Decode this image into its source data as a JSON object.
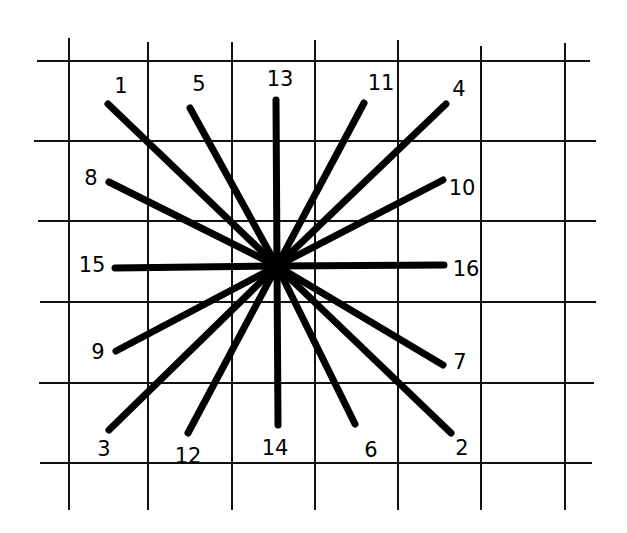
{
  "diagram": {
    "type": "radial line star on grid paper",
    "colors": {
      "background": "#ffffff",
      "ink": "#000000"
    },
    "center": {
      "x": 277,
      "y": 266
    },
    "grid": {
      "vertical": [
        {
          "x": 69,
          "y1": 38,
          "y2": 510
        },
        {
          "x": 148,
          "y1": 42,
          "y2": 510
        },
        {
          "x": 232,
          "y1": 42,
          "y2": 510
        },
        {
          "x": 315,
          "y1": 40,
          "y2": 510
        },
        {
          "x": 398,
          "y1": 40,
          "y2": 510
        },
        {
          "x": 481,
          "y1": 46,
          "y2": 510
        },
        {
          "x": 565,
          "y1": 43,
          "y2": 510
        }
      ],
      "horizontal": [
        {
          "y": 61,
          "x1": 37,
          "x2": 590
        },
        {
          "y": 141,
          "x1": 34,
          "x2": 596
        },
        {
          "y": 221,
          "x1": 38,
          "x2": 596
        },
        {
          "y": 302,
          "x1": 40,
          "x2": 596
        },
        {
          "y": 383,
          "x1": 39,
          "x2": 594
        },
        {
          "y": 463,
          "x1": 40,
          "x2": 592
        }
      ]
    },
    "rays": [
      {
        "label": "1",
        "end": {
          "x": 108,
          "y": 104
        },
        "label_pos": {
          "x": 121,
          "y": 87
        }
      },
      {
        "label": "2",
        "end": {
          "x": 451,
          "y": 433
        },
        "label_pos": {
          "x": 462,
          "y": 449
        }
      },
      {
        "label": "3",
        "end": {
          "x": 109,
          "y": 430
        },
        "label_pos": {
          "x": 104,
          "y": 450
        }
      },
      {
        "label": "4",
        "end": {
          "x": 446,
          "y": 104
        },
        "label_pos": {
          "x": 459,
          "y": 90
        }
      },
      {
        "label": "5",
        "end": {
          "x": 190,
          "y": 108
        },
        "label_pos": {
          "x": 199,
          "y": 85
        }
      },
      {
        "label": "6",
        "end": {
          "x": 355,
          "y": 424
        },
        "label_pos": {
          "x": 371,
          "y": 451
        }
      },
      {
        "label": "7",
        "end": {
          "x": 443,
          "y": 365
        },
        "label_pos": {
          "x": 460,
          "y": 363
        }
      },
      {
        "label": "8",
        "end": {
          "x": 109,
          "y": 182
        },
        "label_pos": {
          "x": 91,
          "y": 179
        }
      },
      {
        "label": "9",
        "end": {
          "x": 116,
          "y": 351
        },
        "label_pos": {
          "x": 98,
          "y": 353
        }
      },
      {
        "label": "10",
        "end": {
          "x": 443,
          "y": 180
        },
        "label_pos": {
          "x": 462,
          "y": 189
        }
      },
      {
        "label": "11",
        "end": {
          "x": 364,
          "y": 103
        },
        "label_pos": {
          "x": 381,
          "y": 84
        }
      },
      {
        "label": "12",
        "end": {
          "x": 188,
          "y": 433
        },
        "label_pos": {
          "x": 188,
          "y": 457
        }
      },
      {
        "label": "13",
        "end": {
          "x": 276,
          "y": 100
        },
        "label_pos": {
          "x": 280,
          "y": 80
        }
      },
      {
        "label": "14",
        "end": {
          "x": 278,
          "y": 425
        },
        "label_pos": {
          "x": 275,
          "y": 449
        }
      },
      {
        "label": "15",
        "end": {
          "x": 115,
          "y": 268
        },
        "label_pos": {
          "x": 92,
          "y": 266
        }
      },
      {
        "label": "16",
        "end": {
          "x": 444,
          "y": 265
        },
        "label_pos": {
          "x": 466,
          "y": 270
        }
      }
    ]
  }
}
